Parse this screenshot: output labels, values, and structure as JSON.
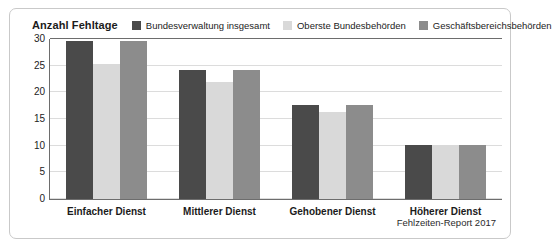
{
  "chart_data": {
    "type": "bar",
    "title": "Anzahl Fehltage",
    "xlabel": "",
    "ylabel": "Anzahl Fehltage",
    "categories": [
      "Einfacher Dienst",
      "Mittlerer Dienst",
      "Gehobener Dienst",
      "Höherer Dienst"
    ],
    "series": [
      {
        "name": "Bundesverwaltung insgesamt",
        "color": "#4a4a4a",
        "values": [
          29.6,
          24.2,
          17.6,
          10.1
        ]
      },
      {
        "name": "Oberste Bundesbehörden",
        "color": "#d9d9d9",
        "values": [
          25.4,
          21.9,
          16.4,
          10.1
        ]
      },
      {
        "name": "Geschäftsbereichsbehörden",
        "color": "#8c8c8c",
        "values": [
          29.6,
          24.2,
          17.6,
          10.1
        ]
      }
    ],
    "ylim": [
      0,
      30
    ],
    "yticks": [
      0,
      5,
      10,
      15,
      20,
      25,
      30
    ],
    "ytick_labels": [
      "0",
      "5",
      "10",
      "15",
      "20",
      "25",
      "30"
    ],
    "grid": true,
    "legend_position": "top"
  },
  "source_note": "Fehlzeiten-Report 2017"
}
